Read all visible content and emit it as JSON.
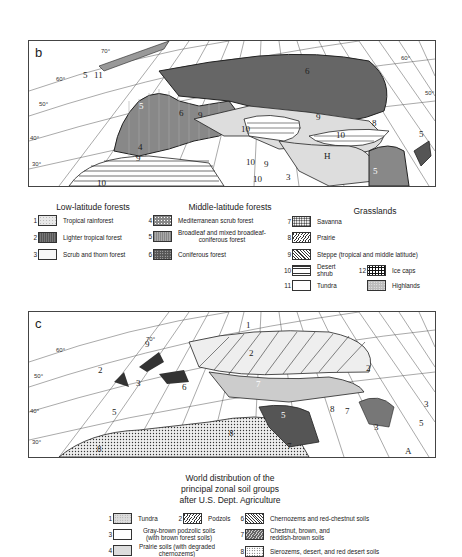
{
  "map_b": {
    "panel_letter": "b",
    "latitude_labels": [
      "70°",
      "60°",
      "50°",
      "40°",
      "30°",
      "60°",
      "50°"
    ],
    "region_labels": [
      {
        "text": "5",
        "x": 83,
        "y": 76
      },
      {
        "text": "11",
        "x": 94,
        "y": 76
      },
      {
        "text": "5",
        "x": 139,
        "y": 107,
        "light": true
      },
      {
        "text": "6",
        "x": 305,
        "y": 72
      },
      {
        "text": "6",
        "x": 179,
        "y": 114
      },
      {
        "text": "9",
        "x": 198,
        "y": 116
      },
      {
        "text": "10",
        "x": 241,
        "y": 130
      },
      {
        "text": "9",
        "x": 316,
        "y": 118
      },
      {
        "text": "10",
        "x": 336,
        "y": 136
      },
      {
        "text": "8",
        "x": 372,
        "y": 124
      },
      {
        "text": "5",
        "x": 419,
        "y": 135
      },
      {
        "text": "4",
        "x": 138,
        "y": 148
      },
      {
        "text": "9",
        "x": 136,
        "y": 159
      },
      {
        "text": "10",
        "x": 246,
        "y": 163
      },
      {
        "text": "9",
        "x": 264,
        "y": 165
      },
      {
        "text": "H",
        "x": 324,
        "y": 157
      },
      {
        "text": "5",
        "x": 373,
        "y": 172,
        "light": true
      },
      {
        "text": "10",
        "x": 253,
        "y": 180
      },
      {
        "text": "3",
        "x": 286,
        "y": 178
      },
      {
        "text": "10",
        "x": 97,
        "y": 184
      }
    ]
  },
  "legend_b": {
    "groups": [
      {
        "heading": "Low-latitude forests",
        "items": [
          {
            "num": "1",
            "label": "Tropical rainforest",
            "pattern": "rainforest"
          },
          {
            "num": "2",
            "label": "Lighter tropical forest",
            "pattern": "lighttrop"
          },
          {
            "num": "3",
            "label": "Scrub and thorn forest",
            "pattern": "scrub"
          }
        ]
      },
      {
        "heading": "Middle-latitude forests",
        "items": [
          {
            "num": "4",
            "label": "Mediterranean scrub forest",
            "pattern": "medit"
          },
          {
            "num": "5",
            "label": "Broadleaf and mixed broadleaf-coniferous forest",
            "pattern": "broadleaf"
          },
          {
            "num": "6",
            "label": "Coniferous forest",
            "pattern": "conifer"
          }
        ]
      },
      {
        "heading": "Grasslands",
        "items": [
          {
            "num": "7",
            "label": "Savanna",
            "pattern": "savanna"
          },
          {
            "num": "8",
            "label": "Prairie",
            "pattern": "prairie"
          },
          {
            "num": "9",
            "label": "Steppe (tropical and middle latitude)",
            "pattern": "steppe"
          },
          {
            "num": "10",
            "label": "Desert shrub",
            "pattern": "desert"
          },
          {
            "num": "11",
            "label": "Tundra",
            "pattern": "tundra"
          },
          {
            "num": "12",
            "label": "Ice caps",
            "pattern": "ice"
          },
          {
            "num": "",
            "label": "Highlands",
            "pattern": "highland"
          }
        ]
      }
    ]
  },
  "map_c": {
    "panel_letter": "c",
    "latitude_labels": [
      "70°",
      "60°",
      "50°",
      "40°",
      "30°"
    ],
    "region_labels": [
      {
        "text": "1",
        "x": 246,
        "y": 326
      },
      {
        "text": "9",
        "x": 145,
        "y:": 345,
        "y": 345
      },
      {
        "text": "2",
        "x": 249,
        "y": 354
      },
      {
        "text": "2",
        "x": 98,
        "y": 371
      },
      {
        "text": "3",
        "x": 136,
        "y": 384
      },
      {
        "text": "2",
        "x": 366,
        "y": 369
      },
      {
        "text": "6",
        "x": 182,
        "y": 388
      },
      {
        "text": "7",
        "x": 256,
        "y": 385,
        "light": true
      },
      {
        "text": "7",
        "x": 95,
        "y": 414,
        "light": true
      },
      {
        "text": "5",
        "x": 112,
        "y": 413
      },
      {
        "text": "5",
        "x": 281,
        "y": 416,
        "light": true
      },
      {
        "text": "8",
        "x": 330,
        "y": 410
      },
      {
        "text": "7",
        "x": 345,
        "y": 412
      },
      {
        "text": "3",
        "x": 374,
        "y": 428
      },
      {
        "text": "3",
        "x": 424,
        "y": 405
      },
      {
        "text": "5",
        "x": 419,
        "y": 424
      },
      {
        "text": "8",
        "x": 229,
        "y": 434
      },
      {
        "text": "7",
        "x": 287,
        "y": 447
      },
      {
        "text": "8",
        "x": 97,
        "y": 450
      },
      {
        "text": "A",
        "x": 405,
        "y": 452
      }
    ]
  },
  "soil_caption": {
    "line1": "World distribution of the",
    "line2": "principal zonal soil groups",
    "line3": "after U.S. Dept. Agriculture"
  },
  "legend_c": {
    "items": [
      {
        "num": "1",
        "label": "Tundra",
        "pattern": "tundra"
      },
      {
        "num": "2",
        "label": "Podzols",
        "pattern": "podzol"
      },
      {
        "num": "3",
        "label": "Gray-brown podzolic soils (with brown forest soils)",
        "pattern": "graybrown"
      },
      {
        "num": "4",
        "label": "Prairie soils (with degraded chernozems)",
        "pattern": "prairie"
      },
      {
        "num": "6",
        "label": "Chernozems and red-chestnut soils",
        "pattern": "chernozem"
      },
      {
        "num": "7",
        "label": "Chestnut, brown, and reddish-brown soils",
        "pattern": "chestnut"
      },
      {
        "num": "8",
        "label": "Sierozems, desert, and red desert soils",
        "pattern": "sierozem"
      }
    ]
  }
}
